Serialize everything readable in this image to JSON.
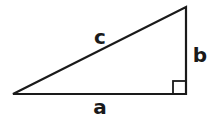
{
  "diagram": {
    "type": "right-triangle",
    "stroke_color": "#1a1a1a",
    "background": "#ffffff",
    "vertices": {
      "left": {
        "x": 13,
        "y": 94
      },
      "right_angle": {
        "x": 186,
        "y": 94
      },
      "top": {
        "x": 186,
        "y": 7
      }
    },
    "right_angle_marker": {
      "x": 173,
      "y": 81,
      "size": 13
    },
    "labels": {
      "hypotenuse": "c",
      "vertical_leg": "b",
      "horizontal_leg": "a"
    }
  }
}
